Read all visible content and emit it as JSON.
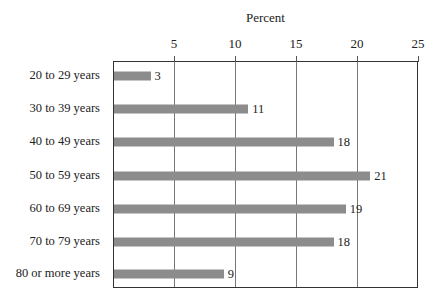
{
  "chart_data": {
    "type": "bar",
    "orientation": "horizontal",
    "title": "",
    "xlabel": "Percent",
    "ylabel": "",
    "xlim": [
      0,
      25
    ],
    "xticks": [
      5,
      10,
      15,
      20,
      25
    ],
    "grid": true,
    "legend": null,
    "categories": [
      "20 to 29 years",
      "30 to 39 years",
      "40 to 49 years",
      "50 to 59 years",
      "60 to 69 years",
      "70 to 79 years",
      "80 or more years"
    ],
    "values": [
      3,
      11,
      18,
      21,
      19,
      18,
      9
    ],
    "bar_color": "#8c8c8c"
  }
}
